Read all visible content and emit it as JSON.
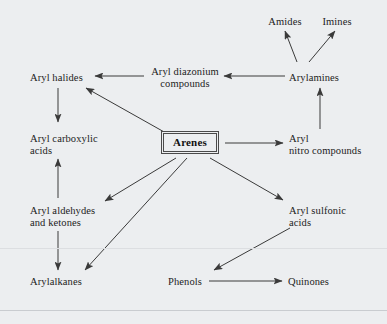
{
  "figure": {
    "type": "reaction-scheme-diagram",
    "background_color": "#eceef0",
    "text_color": "#1c1c1c",
    "arrow_color": "#3a3a3a",
    "center_node": "Arenes"
  },
  "nodes": [
    {
      "id": "amides",
      "label": "Amides",
      "x": 279,
      "y": 16,
      "align": "center"
    },
    {
      "id": "imines",
      "label": "Imines",
      "x": 327,
      "y": 16,
      "align": "center"
    },
    {
      "id": "aryl-diazonium",
      "label": "Aryl diazonium\ncompounds",
      "x": 153,
      "y": 66,
      "align": "center"
    },
    {
      "id": "arylamines",
      "label": "Arylamines",
      "x": 289,
      "y": 72,
      "align": "left"
    },
    {
      "id": "aryl-halides",
      "label": "Aryl halides",
      "x": 30,
      "y": 72,
      "align": "left"
    },
    {
      "id": "aryl-carboxylic",
      "label": "Aryl carboxylic\nacids",
      "x": 30,
      "y": 133,
      "align": "left"
    },
    {
      "id": "aryl-nitro",
      "label": "Aryl\nnitro compounds",
      "x": 289,
      "y": 133,
      "align": "left"
    },
    {
      "id": "aryl-aldehydes",
      "label": "Aryl aldehydes\nand ketones",
      "x": 30,
      "y": 205,
      "align": "left"
    },
    {
      "id": "aryl-sulfonic",
      "label": "Aryl sulfonic\nacids",
      "x": 289,
      "y": 205,
      "align": "left"
    },
    {
      "id": "arylalkanes",
      "label": "Arylalkanes",
      "x": 30,
      "y": 276,
      "align": "left"
    },
    {
      "id": "phenols",
      "label": "Phenols",
      "x": 168,
      "y": 276,
      "align": "left"
    },
    {
      "id": "quinones",
      "label": "Quinones",
      "x": 288,
      "y": 276,
      "align": "left"
    }
  ],
  "center": {
    "id": "arenes",
    "label": "Arenes"
  },
  "edges": [
    {
      "id": "arylamines-to-amides",
      "from": "arylamines",
      "to": "amides",
      "x1": 297,
      "y1": 62,
      "x2": 285,
      "y2": 31
    },
    {
      "id": "arylamines-to-imines",
      "from": "arylamines",
      "to": "imines",
      "x1": 309,
      "y1": 62,
      "x2": 335,
      "y2": 31
    },
    {
      "id": "arylamines-to-diazonium",
      "from": "arylamines",
      "to": "aryl-diazonium",
      "x1": 285,
      "y1": 76,
      "x2": 224,
      "y2": 76
    },
    {
      "id": "diazonium-to-aryl-halides",
      "from": "aryl-diazonium",
      "to": "aryl-halides",
      "x1": 144,
      "y1": 76,
      "x2": 95,
      "y2": 76
    },
    {
      "id": "aryl-halides-to-carboxylic",
      "from": "aryl-halides",
      "to": "aryl-carboxylic",
      "x1": 58,
      "y1": 88,
      "x2": 58,
      "y2": 122
    },
    {
      "id": "arenes-to-aryl-halides",
      "from": "arenes",
      "to": "aryl-halides",
      "x1": 166,
      "y1": 133,
      "x2": 86,
      "y2": 88
    },
    {
      "id": "arenes-to-aryl-nitro",
      "from": "arenes",
      "to": "aryl-nitro",
      "x1": 225,
      "y1": 143,
      "x2": 283,
      "y2": 143
    },
    {
      "id": "aryl-nitro-to-arylamines",
      "from": "aryl-nitro",
      "to": "arylamines",
      "x1": 320,
      "y1": 129,
      "x2": 320,
      "y2": 88
    },
    {
      "id": "aldehydes-to-carboxylic",
      "from": "aryl-aldehydes",
      "to": "aryl-carboxylic",
      "x1": 58,
      "y1": 198,
      "x2": 58,
      "y2": 159
    },
    {
      "id": "arenes-to-aldehydes",
      "from": "arenes",
      "to": "aryl-aldehydes",
      "x1": 176,
      "y1": 158,
      "x2": 105,
      "y2": 201
    },
    {
      "id": "arenes-to-arylalkanes",
      "from": "arenes",
      "to": "arylalkanes",
      "x1": 187,
      "y1": 158,
      "x2": 85,
      "y2": 270
    },
    {
      "id": "aldehydes-to-arylalkanes",
      "from": "aryl-aldehydes",
      "to": "arylalkanes",
      "x1": 58,
      "y1": 231,
      "x2": 58,
      "y2": 270
    },
    {
      "id": "arenes-to-aryl-sulfonic",
      "from": "arenes",
      "to": "aryl-sulfonic",
      "x1": 210,
      "y1": 158,
      "x2": 283,
      "y2": 200
    },
    {
      "id": "aryl-sulfonic-to-phenols",
      "from": "aryl-sulfonic",
      "to": "phenols",
      "x1": 290,
      "y1": 228,
      "x2": 214,
      "y2": 270
    },
    {
      "id": "phenols-to-quinones",
      "from": "phenols",
      "to": "quinones",
      "x1": 209,
      "y1": 281,
      "x2": 282,
      "y2": 281
    }
  ],
  "rules": [
    {
      "id": "rule-upper",
      "y": 248
    },
    {
      "id": "rule-lower",
      "y": 310
    }
  ]
}
